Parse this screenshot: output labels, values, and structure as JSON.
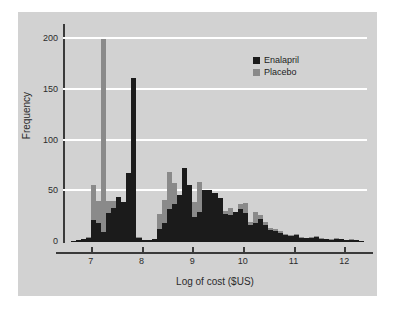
{
  "figure": {
    "background": "#ffffff",
    "panel_color": "#d2d2d2"
  },
  "legend": {
    "position": "top-right",
    "entries": [
      {
        "label": "Enalapril",
        "color": "#1b1b1b"
      },
      {
        "label": "Placebo",
        "color": "#8a8a8a"
      }
    ]
  },
  "chart_data": {
    "type": "bar",
    "title": "",
    "subtitle": "",
    "xlabel": "Log of cost ($US)",
    "ylabel": "Frequency",
    "xlim": [
      6.45,
      12.45
    ],
    "ylim": [
      0,
      215
    ],
    "xticks": [
      7,
      8,
      9,
      10,
      11,
      12
    ],
    "xtick_labels": [
      "7",
      "8",
      "9",
      "10",
      "11",
      "12"
    ],
    "yticks": [
      0,
      50,
      100,
      150,
      200
    ],
    "ytick_labels": [
      "0",
      "50",
      "100",
      "150",
      "200"
    ],
    "grid": "horizontal-white",
    "gridline_values": [
      50,
      100,
      150,
      200
    ],
    "legend_position": "upper right",
    "bin_width": 0.1,
    "bin_centers": [
      6.55,
      6.65,
      6.75,
      6.85,
      6.95,
      7.05,
      7.15,
      7.25,
      7.35,
      7.45,
      7.55,
      7.65,
      7.75,
      7.85,
      7.95,
      8.05,
      8.15,
      8.25,
      8.35,
      8.45,
      8.55,
      8.65,
      8.75,
      8.85,
      8.95,
      9.05,
      9.15,
      9.25,
      9.35,
      9.45,
      9.55,
      9.65,
      9.75,
      9.85,
      9.95,
      10.05,
      10.15,
      10.25,
      10.35,
      10.45,
      10.55,
      10.65,
      10.75,
      10.85,
      10.95,
      11.05,
      11.15,
      11.25,
      11.35,
      11.45,
      11.55,
      11.65,
      11.75,
      11.85,
      11.95,
      12.05,
      12.15,
      12.25,
      12.35
    ],
    "series": [
      {
        "name": "Placebo",
        "color": "#8a8a8a",
        "values": [
          0,
          1,
          2,
          3,
          5,
          56,
          40,
          200,
          40,
          40,
          44,
          39,
          36,
          30,
          5,
          2,
          2,
          3,
          28,
          41,
          69,
          58,
          46,
          49,
          56,
          39,
          59,
          50,
          50,
          44,
          41,
          31,
          34,
          30,
          37,
          38,
          20,
          30,
          27,
          20,
          14,
          13,
          11,
          8,
          7,
          8,
          5,
          4,
          5,
          6,
          4,
          3,
          3,
          4,
          3,
          2,
          3,
          2,
          1
        ]
      },
      {
        "name": "Enalapril",
        "color": "#1b1b1b",
        "values": [
          0,
          1,
          2,
          3,
          4,
          22,
          19,
          10,
          29,
          34,
          44,
          39,
          68,
          162,
          4,
          2,
          2,
          3,
          13,
          19,
          33,
          37,
          46,
          73,
          56,
          25,
          30,
          51,
          51,
          48,
          43,
          28,
          27,
          30,
          33,
          29,
          17,
          19,
          23,
          17,
          12,
          11,
          9,
          7,
          6,
          7,
          4,
          4,
          4,
          5,
          3,
          3,
          2,
          3,
          3,
          2,
          2,
          2,
          1
        ]
      }
    ]
  }
}
